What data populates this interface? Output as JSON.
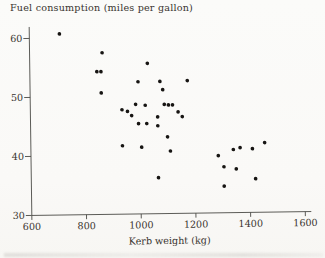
{
  "figure": {
    "title": "Fuel consumption (miles per gallon)",
    "xlabel": "Kerb weight (kg)"
  },
  "colors": {
    "ink": "#4a4a46",
    "text": "#39342f",
    "dot": "#171513",
    "paper": "#fbfbf9"
  },
  "chart_data": {
    "type": "scatter",
    "title": "Fuel consumption (miles per gallon)",
    "xlabel": "Kerb weight (kg)",
    "ylabel": "Fuel consumption (miles per gallon)",
    "xlim": [
      600,
      1650
    ],
    "ylim": [
      30,
      62
    ],
    "x_ticks": [
      600,
      800,
      1000,
      1200,
      1400,
      1600
    ],
    "y_ticks": [
      30,
      40,
      50,
      60
    ],
    "grid": false,
    "legend": null,
    "points": [
      [
        710,
        60.7
      ],
      [
        865,
        57.4
      ],
      [
        1030,
        55.5
      ],
      [
        845,
        54.2
      ],
      [
        860,
        54.2
      ],
      [
        995,
        52.4
      ],
      [
        1075,
        52.4
      ],
      [
        1175,
        52.5
      ],
      [
        1085,
        51.0
      ],
      [
        860,
        50.6
      ],
      [
        985,
        48.6
      ],
      [
        1020,
        48.4
      ],
      [
        1090,
        48.5
      ],
      [
        1105,
        48.4
      ],
      [
        1120,
        48.4
      ],
      [
        935,
        47.7
      ],
      [
        955,
        47.4
      ],
      [
        1140,
        47.2
      ],
      [
        970,
        46.7
      ],
      [
        1065,
        46.4
      ],
      [
        1155,
        46.4
      ],
      [
        995,
        45.3
      ],
      [
        1025,
        45.3
      ],
      [
        1065,
        44.9
      ],
      [
        1100,
        43.0
      ],
      [
        935,
        41.6
      ],
      [
        1005,
        41.3
      ],
      [
        1110,
        40.6
      ],
      [
        1065,
        36.1
      ],
      [
        1285,
        39.7
      ],
      [
        1340,
        40.7
      ],
      [
        1365,
        41.0
      ],
      [
        1410,
        40.8
      ],
      [
        1455,
        41.8
      ],
      [
        1305,
        37.8
      ],
      [
        1350,
        37.4
      ],
      [
        1305,
        34.5
      ],
      [
        1420,
        35.7
      ]
    ]
  }
}
